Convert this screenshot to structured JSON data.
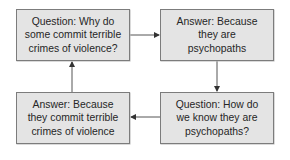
{
  "diagram": {
    "type": "cycle",
    "boxes": {
      "top_left": "Question: Why do\nsome commit terrible\ncrimes of violence?",
      "top_right": "Answer: Because\nthey are\npsychopaths",
      "bottom_right": "Question: How do\nwe know they are\npsychopaths?",
      "bottom_left": "Answer: Because\nthey commit terrible\ncrimes of violence"
    },
    "arrows": [
      {
        "from": "top_left",
        "to": "top_right",
        "direction": "right"
      },
      {
        "from": "top_right",
        "to": "bottom_right",
        "direction": "down"
      },
      {
        "from": "bottom_right",
        "to": "bottom_left",
        "direction": "left"
      },
      {
        "from": "bottom_left",
        "to": "top_left",
        "direction": "up"
      }
    ],
    "colors": {
      "box_fill": "#e4e4e4",
      "box_border": "#7c7c7c",
      "text": "#262626",
      "arrow": "#333333"
    }
  }
}
